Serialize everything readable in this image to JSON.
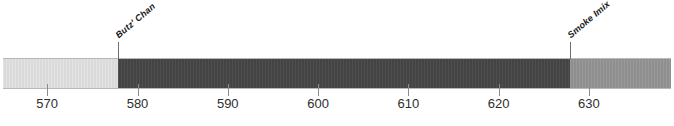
{
  "chart_data": {
    "type": "bar",
    "orientation": "horizontal",
    "title": "",
    "subtitle": "",
    "xlabel": "",
    "ylabel": "",
    "xlim": [
      565.1,
      639.1
    ],
    "grid": false,
    "legend": "none",
    "tick_labels": [
      "570",
      "580",
      "590",
      "600",
      "610",
      "620",
      "630"
    ],
    "tick_values": [
      570,
      580,
      590,
      600,
      610,
      620,
      630
    ],
    "annotations": [
      {
        "label": "Butz' Chan",
        "value": 577.8
      },
      {
        "label": "Smoke Imix",
        "value": 627.9
      }
    ],
    "series": [
      {
        "name": "segment-1",
        "start": 565.1,
        "end": 577.8,
        "color": "#e2e2e2"
      },
      {
        "name": "segment-2",
        "start": 577.8,
        "end": 627.9,
        "color": "#464646"
      },
      {
        "name": "segment-3",
        "start": 627.9,
        "end": 639.1,
        "color": "#949494"
      }
    ]
  },
  "colors": {
    "background": "#ffffff",
    "axis": "#8d8d8d",
    "text": "#2e2e2e",
    "annotation_text": "#161616",
    "segment_light": "#e2e2e2",
    "segment_dark": "#464646",
    "segment_mid": "#949494"
  }
}
